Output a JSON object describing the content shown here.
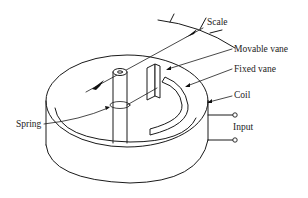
{
  "diagram": {
    "labels": {
      "scale": "Scale",
      "movable_vane": "Movable vane",
      "fixed_vane": "Fixed vane",
      "coil": "Coil",
      "spring": "Spring",
      "input": "Input"
    },
    "colors": {
      "line": "#1a1a1a",
      "background": "#ffffff",
      "text": "#222222"
    }
  }
}
